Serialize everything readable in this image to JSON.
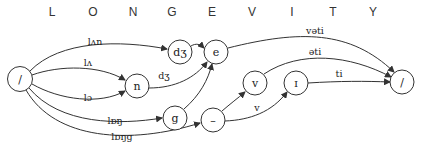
{
  "title": {
    "letters": [
      "L",
      "O",
      "N",
      "G",
      "E",
      "V",
      "I",
      "T",
      "Y"
    ],
    "x_positions": [
      52,
      93,
      133,
      172,
      212,
      252,
      292,
      333,
      373
    ]
  },
  "nodes": [
    {
      "id": "start",
      "label": "/",
      "x": 20,
      "y": 79
    },
    {
      "id": "dz",
      "label": "dʒ",
      "x": 180,
      "y": 52
    },
    {
      "id": "e",
      "label": "e",
      "x": 216,
      "y": 52
    },
    {
      "id": "n",
      "label": "n",
      "x": 137,
      "y": 86
    },
    {
      "id": "g",
      "label": "g",
      "x": 175,
      "y": 118
    },
    {
      "id": "dash",
      "label": "–",
      "x": 213,
      "y": 120
    },
    {
      "id": "v",
      "label": "v",
      "x": 255,
      "y": 83
    },
    {
      "id": "i",
      "label": "ɪ",
      "x": 296,
      "y": 83
    },
    {
      "id": "end",
      "label": "/",
      "x": 402,
      "y": 82
    }
  ],
  "edges": [
    {
      "from": "start",
      "to": "dz",
      "label": "lʌn",
      "label_x": 95,
      "label_y": 45
    },
    {
      "from": "start",
      "to": "n",
      "label": "lʌ",
      "label_x": 88,
      "label_y": 66
    },
    {
      "from": "start",
      "to": "n",
      "label": "lɔ",
      "label_x": 88,
      "label_y": 101
    },
    {
      "from": "start",
      "to": "g",
      "label": "lɒŋ",
      "label_x": 115,
      "label_y": 124
    },
    {
      "from": "start",
      "to": "dash",
      "label": "lɒŋg",
      "label_x": 122,
      "label_y": 137
    },
    {
      "from": "dz",
      "to": "e",
      "label": ""
    },
    {
      "from": "n",
      "to": "e",
      "label": "dʒ",
      "label_x": 164,
      "label_y": 78
    },
    {
      "from": "g",
      "to": "e",
      "label": ""
    },
    {
      "from": "dash",
      "to": "v",
      "label": ""
    },
    {
      "from": "dash",
      "to": "i",
      "label": "v",
      "label_x": 257,
      "label_y": 108
    },
    {
      "from": "e",
      "to": "end",
      "label": "vəti",
      "label_x": 315,
      "label_y": 34
    },
    {
      "from": "v",
      "to": "end",
      "label": "əti",
      "label_x": 315,
      "label_y": 54
    },
    {
      "from": "i",
      "to": "end",
      "label": "ti",
      "label_x": 339,
      "label_y": 78
    }
  ],
  "colors": {
    "stroke": "#333333",
    "background": "#ffffff"
  }
}
